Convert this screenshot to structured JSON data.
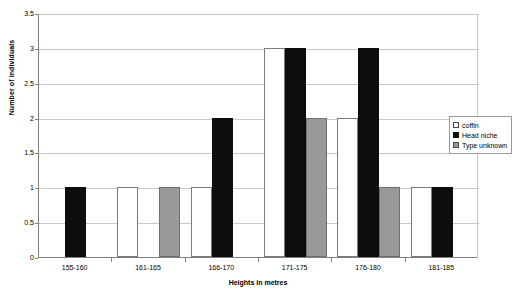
{
  "chart_data": {
    "type": "bar",
    "title": "",
    "xlabel": "Heights in metres",
    "ylabel": "Number of individuals",
    "categories": [
      "155-160",
      "161-165",
      "166-170",
      "171-175",
      "176-180",
      "181-185"
    ],
    "series": [
      {
        "name": "coffin",
        "color": "#ffffff",
        "values": [
          0,
          1,
          1,
          3,
          2,
          1
        ]
      },
      {
        "name": "Head niche",
        "color": "#0d0d0d",
        "values": [
          1,
          0,
          2,
          3,
          3,
          1
        ]
      },
      {
        "name": "Type unknown",
        "color": "#999999",
        "values": [
          0,
          1,
          0,
          2,
          1,
          0
        ]
      }
    ],
    "ylim": [
      0,
      3.5
    ],
    "yticks": [
      "0",
      "0.5",
      "1",
      "1.5",
      "2",
      "2.5",
      "3",
      "3.5"
    ],
    "ytick_values": [
      0,
      0.5,
      1,
      1.5,
      2,
      2.5,
      3,
      3.5
    ],
    "grid": true,
    "legend_position": "right-inside"
  },
  "legend": {
    "items": [
      {
        "label": "coffin"
      },
      {
        "label": "Head niche"
      },
      {
        "label": "Type unknown"
      }
    ]
  }
}
